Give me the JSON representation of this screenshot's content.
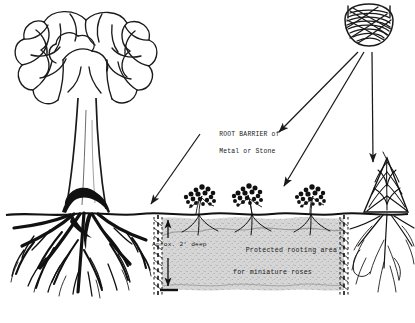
{
  "diagram": {
    "background_color": "#ffffff",
    "ink_color": "#1a1a1a",
    "soil_fill_color": "#c9c9c9",
    "labels": {
      "root_barrier": "ROOT BARRIER of\nMetal or Stone",
      "root_barrier_line1": "ROOT BARRIER of",
      "root_barrier_line2": "Metal or Stone",
      "depth": "Aprox. 2' deep",
      "protected_area_line1": "Protected rooting area",
      "protected_area_line2": "for miniature roses"
    },
    "elements": {
      "sun": "sun-scribble",
      "shade_tree": "large-deciduous-tree",
      "tree_roots": "dense-root-mass",
      "ground_line": "ground-surface-line",
      "barrier_left": "dashed-root-barrier-left",
      "barrier_right": "dashed-root-barrier-right",
      "depth_arrow": "depth-dimension-arrow",
      "roses": [
        "miniature-rose-1",
        "miniature-rose-2",
        "miniature-rose-3"
      ],
      "conifer": "evergreen-tree-right",
      "sun_rays": [
        "sun-ray-left",
        "sun-ray-middle",
        "sun-ray-right"
      ],
      "leader_line": "root-barrier-leader-arrow"
    }
  }
}
